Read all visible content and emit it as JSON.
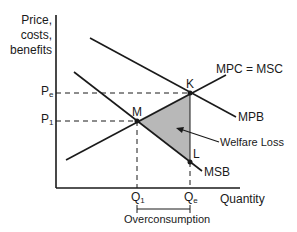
{
  "diagram": {
    "type": "economics-externality-diagram",
    "y_axis_label": "Price, costs, benefits",
    "y_axis_label_lines": [
      "Price,",
      "costs,",
      "benefits"
    ],
    "x_axis_label": "Quantity",
    "curves": [
      {
        "name": "MPC = MSC",
        "label": "MPC = MSC",
        "type": "supply"
      },
      {
        "name": "MPB",
        "label": "MPB",
        "type": "private-benefit"
      },
      {
        "name": "MSB",
        "label": "MSB",
        "type": "social-benefit"
      }
    ],
    "points": [
      {
        "label": "M",
        "desc": "Social optimum (MSC = MSB)"
      },
      {
        "label": "K",
        "desc": "Market equilibrium (MPC = MPB)"
      },
      {
        "label": "L",
        "desc": "MSB at Qe"
      }
    ],
    "price_ticks": {
      "pe": {
        "base": "P",
        "sub": "e"
      },
      "p1": {
        "base": "P",
        "sub": "1"
      }
    },
    "quantity_ticks": {
      "q1": {
        "base": "Q",
        "sub": "1"
      },
      "qe": {
        "base": "Q",
        "sub": "e"
      }
    },
    "annotations": {
      "welfare_loss": "Welfare Loss",
      "overconsumption": "Overconsumption"
    },
    "colors": {
      "line": "#1a1a1a",
      "welfare_fill": "#b8b8b8"
    }
  }
}
